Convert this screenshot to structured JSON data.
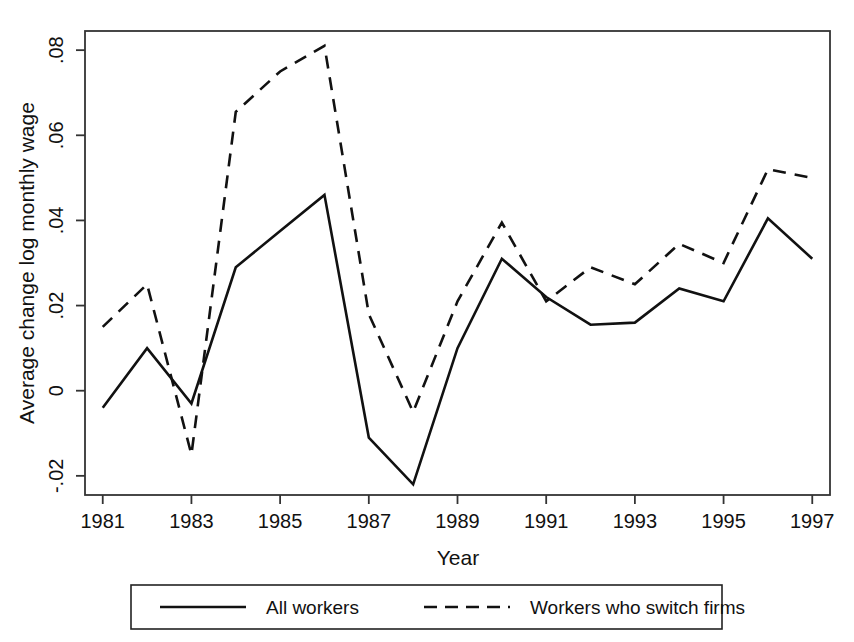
{
  "chart_data": {
    "type": "line",
    "title": "",
    "xlabel": "Year",
    "ylabel": "Average change log monthly wage",
    "x": [
      1981,
      1982,
      1983,
      1984,
      1985,
      1986,
      1987,
      1988,
      1989,
      1990,
      1991,
      1992,
      1993,
      1994,
      1995,
      1996,
      1997
    ],
    "xlim": [
      1980.6,
      1997.4
    ],
    "ylim": [
      -0.0245,
      0.0845
    ],
    "xticks": [
      1981,
      1983,
      1985,
      1987,
      1989,
      1991,
      1993,
      1995,
      1997
    ],
    "xtick_labels": [
      "1981",
      "1983",
      "1985",
      "1987",
      "1989",
      "1991",
      "1993",
      "1995",
      "1997"
    ],
    "yticks": [
      -0.02,
      0,
      0.02,
      0.04,
      0.06,
      0.08
    ],
    "ytick_labels": [
      "-.02",
      "0",
      ".02",
      ".04",
      ".06",
      ".08"
    ],
    "grid": false,
    "legend_position": "below",
    "series": [
      {
        "name": "All workers",
        "style": "solid",
        "color": "#111111",
        "values": [
          -0.004,
          0.01,
          -0.003,
          0.029,
          0.0375,
          0.046,
          -0.011,
          -0.022,
          0.01,
          0.031,
          0.022,
          0.0155,
          0.016,
          0.024,
          0.021,
          0.0405,
          0.031
        ]
      },
      {
        "name": "Workers who switch firms",
        "style": "dashed",
        "color": "#111111",
        "values": [
          0.015,
          0.025,
          -0.015,
          0.0655,
          0.075,
          0.081,
          0.018,
          -0.005,
          0.021,
          0.0395,
          0.021,
          0.029,
          0.025,
          0.0345,
          0.03,
          0.052,
          0.05
        ]
      }
    ]
  },
  "legend": {
    "entries": [
      {
        "label": "All workers",
        "style": "solid"
      },
      {
        "label": "Workers who switch firms",
        "style": "dashed"
      }
    ]
  },
  "axes": {
    "x_title": "Year",
    "y_title": "Average change log monthly wage"
  },
  "colors": {
    "line": "#111111",
    "axis": "#333333",
    "background": "#ffffff"
  }
}
